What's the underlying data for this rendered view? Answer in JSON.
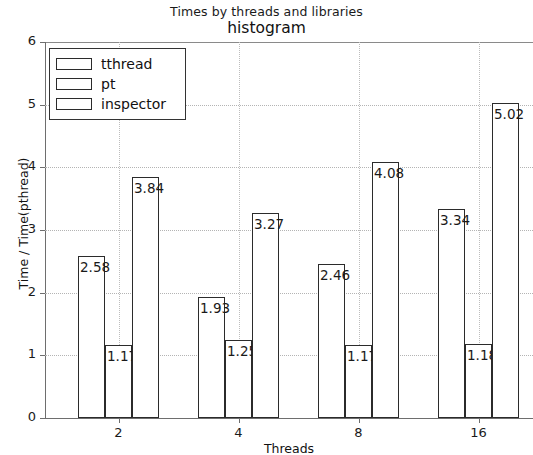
{
  "chart_data": {
    "type": "bar",
    "title": "histogram",
    "suptitle": "Times by threads and libraries",
    "xlabel": "Threads",
    "ylabel": "Time / Time(pthread)",
    "categories": [
      "2",
      "4",
      "8",
      "16"
    ],
    "xtick_labels": [
      "2",
      "4",
      "8",
      "16"
    ],
    "ytick_labels": [
      "0",
      "1",
      "2",
      "3",
      "4",
      "5",
      "6"
    ],
    "ylim": [
      0,
      6
    ],
    "grid": "dotted",
    "legend_position": "upper left",
    "series": [
      {
        "name": "tthread",
        "values": [
          2.58,
          1.93,
          2.46,
          3.34
        ],
        "labels": [
          "2.58",
          "1.93",
          "2.46",
          "3.34"
        ]
      },
      {
        "name": "pt",
        "values": [
          1.17,
          1.25,
          1.17,
          1.18
        ],
        "labels": [
          "1.17",
          "1.25",
          "1.17",
          "1.18"
        ]
      },
      {
        "name": "inspector",
        "values": [
          3.84,
          3.27,
          4.08,
          5.02
        ],
        "labels": [
          "3.84",
          "3.27",
          "4.08",
          "5.02"
        ]
      }
    ],
    "colors": {
      "bar_face": "#ffffff",
      "bar_edge": "#2b2b2b",
      "grid": "#b4b4b4",
      "axis": "#6e6e6e"
    }
  },
  "legend": {
    "items": [
      {
        "label": "tthread"
      },
      {
        "label": "pt"
      },
      {
        "label": "inspector"
      }
    ]
  },
  "yticks": [
    {
      "label": "6"
    },
    {
      "label": "5"
    },
    {
      "label": "4"
    },
    {
      "label": "3"
    },
    {
      "label": "2"
    },
    {
      "label": "1"
    },
    {
      "label": "0"
    }
  ],
  "xticks": [
    {
      "label": "2"
    },
    {
      "label": "4"
    },
    {
      "label": "8"
    },
    {
      "label": "16"
    }
  ]
}
